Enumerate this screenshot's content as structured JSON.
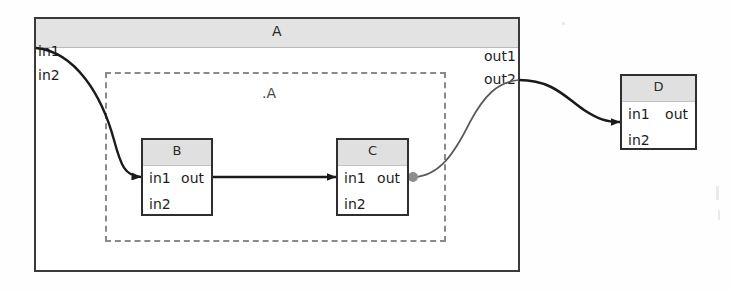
{
  "diagram": {
    "title": "A",
    "outer_block": {
      "name": "A",
      "header_label": "A",
      "inputs": [
        "in1",
        "in2"
      ],
      "outputs": [
        "out1",
        "out2"
      ]
    },
    "subsystem_region": {
      "label": ".A",
      "style": "dashed"
    },
    "blocks": [
      {
        "id": "b",
        "title": "B",
        "inputs": [
          "in1",
          "in2"
        ],
        "outputs": [
          "out"
        ]
      },
      {
        "id": "c",
        "title": "C",
        "inputs": [
          "in1",
          "in2"
        ],
        "outputs": [
          "out"
        ]
      },
      {
        "id": "d",
        "title": "D",
        "inputs": [
          "in1",
          "in2"
        ],
        "outputs": [
          "out"
        ]
      }
    ],
    "connections": [
      {
        "id": "w1",
        "from": "A.in1",
        "to": "B.in1",
        "style": "curved"
      },
      {
        "id": "w2",
        "from": "B.out",
        "to": "C.in1",
        "style": "straight"
      },
      {
        "id": "w3",
        "from": "C.out",
        "to": "A.out2",
        "style": "curved"
      },
      {
        "id": "w4",
        "from": "A.out2",
        "to": "D.in1",
        "style": "curved"
      }
    ],
    "colors": {
      "block_border": "#2e2e2e",
      "block_header": "#e0e0e0",
      "outer_header": "#e3e3e3",
      "dashed_border": "#8a8a8a",
      "wire": "#1a1a1a",
      "junction_dot": "#8d8d8d",
      "background": "#fefefe"
    }
  }
}
